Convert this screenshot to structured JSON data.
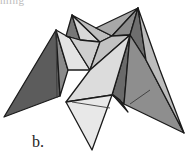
{
  "figure": {
    "panel_label": "b.",
    "top_fragment": "ming",
    "colors": {
      "background": "#ffffff",
      "outline": "#1a1a1a",
      "dark_face": "#5a5a5a",
      "mid_dark_face": "#7a7a7a",
      "mid_face": "#9a9a9a",
      "light_face": "#c8c8c8",
      "lightest_face": "#e6e6e6"
    },
    "faces": [
      {
        "name": "left-spike-outer",
        "points": "56,30 4,117 60,96",
        "fill": "#5c5c5c"
      },
      {
        "name": "left-spike-inner",
        "points": "56,30 60,96 68,70",
        "fill": "#8a8a8a"
      },
      {
        "name": "top-left-peak-back",
        "points": "72,15 66,36 80,40",
        "fill": "#777777"
      },
      {
        "name": "top-left-peak-front",
        "points": "72,15 80,40 100,42",
        "fill": "#d8d8d8"
      },
      {
        "name": "upper-band-left",
        "points": "72,15 100,42 112,36 96,28",
        "fill": "#bdbdbd"
      },
      {
        "name": "upper-band-mid",
        "points": "96,28 112,36 138,8",
        "fill": "#a8a8a8"
      },
      {
        "name": "right-peak-back",
        "points": "138,8 112,36 130,35",
        "fill": "#8c8c8c"
      },
      {
        "name": "right-peak-side",
        "points": "138,8 130,35 146,60",
        "fill": "#6e6e6e"
      },
      {
        "name": "left-center-light",
        "points": "56,30 68,70 90,70 70,38",
        "fill": "#e4e4e4"
      },
      {
        "name": "center-left-face",
        "points": "66,36 70,38 90,70 100,42 80,40",
        "fill": "#cfcfcf"
      },
      {
        "name": "center-right-face",
        "points": "100,42 90,70 130,35 112,36",
        "fill": "#c2c2c2"
      },
      {
        "name": "right-inner-dark",
        "points": "130,35 112,95 124,104",
        "fill": "#6a6a6a"
      },
      {
        "name": "right-spike-mid",
        "points": "130,35 124,104 184,133 146,60",
        "fill": "#8e8e8e"
      },
      {
        "name": "right-spike-light",
        "points": "138,8 146,60 184,133 160,70",
        "fill": "#bcbcbc"
      },
      {
        "name": "small-dark-spike",
        "points": "112,94 120,100 128,112",
        "fill": "#3e3e3e"
      },
      {
        "name": "front-center-face",
        "points": "90,70 130,35 112,95 66,102",
        "fill": "#dcdcdc"
      },
      {
        "name": "bottom-spike",
        "points": "66,102 112,95 92,150",
        "fill": "#e8e8e8"
      }
    ],
    "crease_lines": [
      {
        "name": "left-spike-crease",
        "x1": 56,
        "y1": 30,
        "x2": 57,
        "y2": 98
      },
      {
        "name": "bottom-crease",
        "x1": 72,
        "y1": 102,
        "x2": 110,
        "y2": 108
      },
      {
        "name": "right-spike-crease",
        "x1": 130,
        "y1": 104,
        "x2": 150,
        "y2": 90
      }
    ]
  }
}
